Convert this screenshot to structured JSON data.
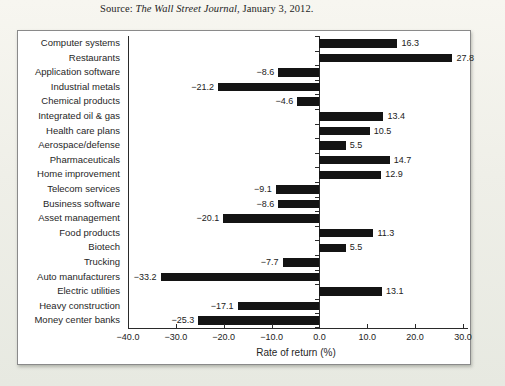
{
  "page": {
    "source": {
      "prefix": "Source: ",
      "publication": "The Wall Street Journal",
      "suffix": ", January 3, 2012."
    }
  },
  "colors": {
    "bar": "#141414",
    "axis": "#2a2a2a",
    "text": "#1f1f1f",
    "box_background": "#ffffff",
    "box_border": "#8a8a8a",
    "page_background": "#efefe8"
  },
  "chart_data": {
    "type": "bar",
    "orientation": "horizontal",
    "title": "",
    "xlabel": "Rate of return (%)",
    "xlim": [
      -40,
      30
    ],
    "xticks": [
      -40,
      -30,
      -20,
      -10,
      0,
      10,
      20,
      30
    ],
    "xtick_labels": [
      "−40.0",
      "−30.0",
      "−20.0",
      "−10.0",
      "0.0",
      "10.0",
      "20.0",
      "30.0"
    ],
    "grid": false,
    "legend": false,
    "value_labels_shown": true,
    "categories": [
      "Computer systems",
      "Restaurants",
      "Application software",
      "Industrial metals",
      "Chemical products",
      "Integrated oil & gas",
      "Health care plans",
      "Aerospace/defense",
      "Pharmaceuticals",
      "Home improvement",
      "Telecom services",
      "Business software",
      "Asset management",
      "Food products",
      "Biotech",
      "Trucking",
      "Auto manufacturers",
      "Electric utilities",
      "Heavy construction",
      "Money center banks"
    ],
    "values": [
      16.3,
      27.8,
      -8.6,
      -21.2,
      -4.6,
      13.4,
      10.5,
      5.5,
      14.7,
      12.9,
      -9.1,
      -8.6,
      -20.1,
      11.3,
      5.5,
      -7.7,
      -33.2,
      13.1,
      -17.1,
      -25.3
    ]
  }
}
